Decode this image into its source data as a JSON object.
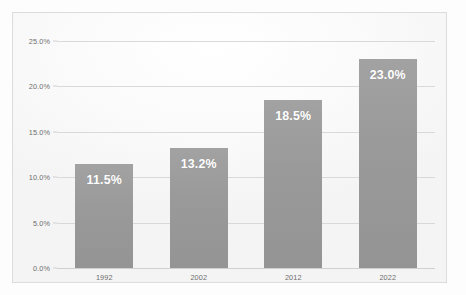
{
  "chart_data": {
    "type": "bar",
    "title": "",
    "subtitle": "",
    "xlabel": "",
    "ylabel": "",
    "categories": [
      "1992",
      "2002",
      "2012",
      "2022"
    ],
    "values": [
      11.5,
      13.2,
      18.5,
      23.0
    ],
    "value_labels": [
      "11.5%",
      "13.2%",
      "18.5%",
      "23.0%"
    ],
    "ylim": [
      0,
      25
    ],
    "ytick_values": [
      25.0,
      20.0,
      15.0,
      10.0,
      5.0,
      0.0
    ],
    "ytick_labels": [
      "25.0%",
      "20.0%",
      "15.0%",
      "10.0%",
      "5.0%",
      "0.0%"
    ],
    "grid": true,
    "legend": false,
    "series": [
      {
        "name": "",
        "values": [
          11.5,
          13.2,
          18.5,
          23.0
        ]
      }
    ],
    "colors": {
      "bar": "#9a9a9a",
      "value_label": "#ffffff",
      "gridline": "#d9d9d9",
      "axis_text": "#6e6e6e",
      "frame_border": "#dcdcdc",
      "plot_background": "#fbfbfb",
      "canvas_background": "#fdfdfd"
    }
  }
}
